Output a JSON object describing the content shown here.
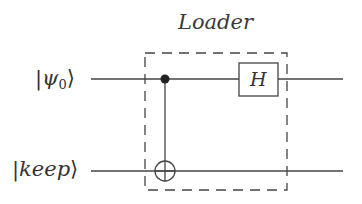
{
  "diagram": {
    "title": "Loader",
    "qubits": [
      {
        "id": "psi0",
        "label_prefix": "|",
        "label_symbol": "ψ",
        "label_subscript": "0",
        "label_suffix": "⟩"
      },
      {
        "id": "keep",
        "label_prefix": "|",
        "label_symbol": "keep",
        "label_suffix": "⟩"
      }
    ],
    "gates": [
      {
        "type": "CNOT",
        "control": "psi0",
        "target": "keep"
      },
      {
        "type": "H",
        "label": "H",
        "qubit": "psi0"
      }
    ],
    "group_box": {
      "label": "Loader",
      "style": "dashed"
    },
    "colors": {
      "line": "#444444",
      "background": "#ffffff"
    }
  }
}
